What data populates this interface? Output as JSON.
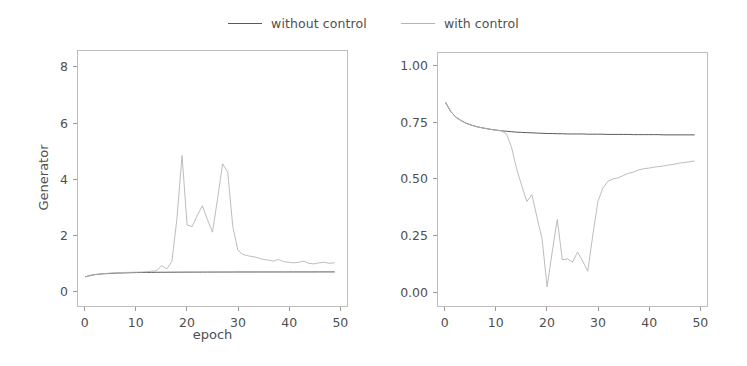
{
  "legend": {
    "position": "top-center",
    "entries": [
      {
        "label": "without control",
        "color": "#595959",
        "icon": "line-swatch"
      },
      {
        "label": "with control",
        "color": "#b4b4b4",
        "icon": "line-swatch"
      }
    ]
  },
  "chart_data": [
    {
      "id": "generator",
      "type": "line",
      "title": "",
      "xlabel": "epoch",
      "ylabel": "Generator",
      "xlim": [
        -1.5,
        51.5
      ],
      "ylim": [
        -0.55,
        8.6
      ],
      "xticks": [
        0,
        10,
        20,
        30,
        40,
        50
      ],
      "yticks": [
        0,
        2,
        4,
        6,
        8
      ],
      "grid": false,
      "series": [
        {
          "name": "without control",
          "color": "#595959",
          "x": [
            0,
            1,
            2,
            3,
            4,
            5,
            6,
            7,
            8,
            9,
            10,
            11,
            12,
            13,
            14,
            15,
            16,
            17,
            18,
            19,
            20,
            21,
            22,
            23,
            24,
            25,
            26,
            27,
            28,
            29,
            30,
            31,
            32,
            33,
            34,
            35,
            36,
            37,
            38,
            39,
            40,
            41,
            42,
            43,
            44,
            45,
            46,
            47,
            48,
            49
          ],
          "values": [
            0.5,
            0.55,
            0.58,
            0.6,
            0.61,
            0.62,
            0.63,
            0.635,
            0.64,
            0.645,
            0.65,
            0.652,
            0.655,
            0.657,
            0.66,
            0.661,
            0.662,
            0.663,
            0.664,
            0.665,
            0.666,
            0.666,
            0.667,
            0.667,
            0.668,
            0.668,
            0.668,
            0.669,
            0.669,
            0.669,
            0.67,
            0.67,
            0.67,
            0.67,
            0.67,
            0.671,
            0.671,
            0.671,
            0.671,
            0.671,
            0.672,
            0.672,
            0.672,
            0.672,
            0.672,
            0.672,
            0.673,
            0.673,
            0.673,
            0.673
          ]
        },
        {
          "name": "with control",
          "color": "#b4b4b4",
          "x": [
            0,
            1,
            2,
            3,
            4,
            5,
            6,
            7,
            8,
            9,
            10,
            11,
            12,
            13,
            14,
            15,
            16,
            17,
            18,
            19,
            20,
            21,
            22,
            23,
            24,
            25,
            26,
            27,
            28,
            29,
            30,
            31,
            32,
            33,
            34,
            35,
            36,
            37,
            38,
            39,
            40,
            41,
            42,
            43,
            44,
            45,
            46,
            47,
            48,
            49
          ],
          "values": [
            0.5,
            0.55,
            0.58,
            0.6,
            0.62,
            0.63,
            0.64,
            0.65,
            0.655,
            0.66,
            0.665,
            0.67,
            0.68,
            0.7,
            0.72,
            0.9,
            0.78,
            1.05,
            2.6,
            4.85,
            2.35,
            2.3,
            2.7,
            3.05,
            2.55,
            2.1,
            3.3,
            4.55,
            4.25,
            2.3,
            1.45,
            1.3,
            1.25,
            1.22,
            1.18,
            1.12,
            1.1,
            1.06,
            1.12,
            1.04,
            1.02,
            1.0,
            1.02,
            1.06,
            0.98,
            0.96,
            1.0,
            1.02,
            0.98,
            1.0
          ]
        }
      ]
    },
    {
      "id": "discriminator",
      "type": "line",
      "title": "",
      "xlabel": "epoch",
      "ylabel": "Discriminator",
      "xlim": [
        -1.5,
        51.5
      ],
      "ylim": [
        -0.065,
        1.06
      ],
      "xticks": [
        0,
        10,
        20,
        30,
        40,
        50
      ],
      "yticks": [
        "0.00",
        "0.25",
        "0.50",
        "0.75",
        "1.00"
      ],
      "ytickvalues": [
        0.0,
        0.25,
        0.5,
        0.75,
        1.0
      ],
      "grid": false,
      "series": [
        {
          "name": "without control",
          "color": "#595959",
          "x": [
            0,
            1,
            2,
            3,
            4,
            5,
            6,
            7,
            8,
            9,
            10,
            11,
            12,
            13,
            14,
            15,
            16,
            17,
            18,
            19,
            20,
            21,
            22,
            23,
            24,
            25,
            26,
            27,
            28,
            29,
            30,
            31,
            32,
            33,
            34,
            35,
            36,
            37,
            38,
            39,
            40,
            41,
            42,
            43,
            44,
            45,
            46,
            47,
            48,
            49
          ],
          "values": [
            0.84,
            0.8,
            0.775,
            0.76,
            0.748,
            0.74,
            0.733,
            0.728,
            0.724,
            0.72,
            0.717,
            0.714,
            0.712,
            0.71,
            0.708,
            0.707,
            0.706,
            0.705,
            0.704,
            0.703,
            0.702,
            0.702,
            0.701,
            0.701,
            0.7,
            0.7,
            0.7,
            0.7,
            0.699,
            0.699,
            0.699,
            0.699,
            0.698,
            0.698,
            0.698,
            0.698,
            0.698,
            0.697,
            0.697,
            0.697,
            0.697,
            0.697,
            0.697,
            0.696,
            0.696,
            0.696,
            0.696,
            0.696,
            0.696,
            0.696
          ]
        },
        {
          "name": "with control",
          "color": "#b4b4b4",
          "x": [
            0,
            1,
            2,
            3,
            4,
            5,
            6,
            7,
            8,
            9,
            10,
            11,
            12,
            13,
            14,
            15,
            16,
            17,
            18,
            19,
            20,
            21,
            22,
            23,
            24,
            25,
            26,
            27,
            28,
            29,
            30,
            31,
            32,
            33,
            34,
            35,
            36,
            37,
            38,
            39,
            40,
            41,
            42,
            43,
            44,
            45,
            46,
            47,
            48,
            49
          ],
          "values": [
            0.84,
            0.8,
            0.775,
            0.76,
            0.748,
            0.74,
            0.733,
            0.728,
            0.724,
            0.72,
            0.717,
            0.714,
            0.7,
            0.64,
            0.545,
            0.47,
            0.4,
            0.43,
            0.33,
            0.235,
            0.02,
            0.175,
            0.32,
            0.14,
            0.145,
            0.13,
            0.175,
            0.135,
            0.09,
            0.25,
            0.4,
            0.46,
            0.49,
            0.5,
            0.505,
            0.515,
            0.525,
            0.53,
            0.54,
            0.545,
            0.548,
            0.552,
            0.555,
            0.558,
            0.562,
            0.565,
            0.57,
            0.573,
            0.576,
            0.58
          ]
        }
      ]
    }
  ]
}
